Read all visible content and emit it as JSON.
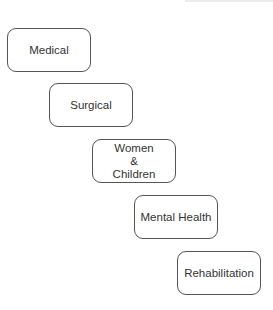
{
  "diagram": {
    "type": "staggered-boxes",
    "nodes": [
      {
        "id": "medical",
        "label": "Medical",
        "x": 7,
        "y": 28
      },
      {
        "id": "surgical",
        "label": "Surgical",
        "x": 49,
        "y": 83
      },
      {
        "id": "women-children",
        "label": "Women\n&\nChildren",
        "x": 92,
        "y": 139
      },
      {
        "id": "mental-health",
        "label": "Mental Health",
        "x": 134,
        "y": 195
      },
      {
        "id": "rehabilitation",
        "label": "Rehabilitation",
        "x": 177,
        "y": 251
      }
    ],
    "style": {
      "border_color": "#555555",
      "text_color": "#333333",
      "background": "#ffffff"
    }
  }
}
